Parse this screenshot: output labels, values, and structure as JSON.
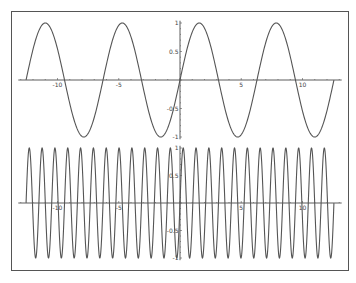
{
  "chart_data": [
    {
      "type": "line",
      "title": "",
      "function": "sin(x)",
      "x_range": [
        -12.566,
        12.566
      ],
      "xlim": [
        -13.2,
        13.2
      ],
      "ylim": [
        -1.05,
        1.05
      ],
      "frequency": 1,
      "x_ticks": [
        -10,
        -5,
        5,
        10
      ],
      "x_tick_labels": [
        "-10",
        "-5",
        "5",
        "10"
      ],
      "y_ticks": [
        1,
        0.5,
        -0.5,
        -1
      ],
      "y_tick_labels": [
        "1",
        "0.5",
        "-0.5",
        "-1"
      ],
      "peaks": 4,
      "xlabel": "",
      "ylabel": "",
      "grid": false,
      "legend": null
    },
    {
      "type": "line",
      "title": "",
      "function": "sin(6x)",
      "x_range": [
        -12.566,
        12.566
      ],
      "xlim": [
        -13.2,
        13.2
      ],
      "ylim": [
        -1.05,
        1.05
      ],
      "frequency": 6,
      "x_ticks": [
        -10,
        -5,
        5,
        10
      ],
      "x_tick_labels": [
        "-10",
        "-5",
        "5",
        "10"
      ],
      "y_ticks": [
        1,
        0.5,
        -0.5,
        -1
      ],
      "y_tick_labels": [
        "1",
        "0.5",
        "-0.5",
        "-1"
      ],
      "peaks": 24,
      "xlabel": "",
      "ylabel": "",
      "grid": false,
      "legend": null
    }
  ],
  "colors": {
    "curve": "#555555",
    "axis": "#333333",
    "frame": "#555555"
  }
}
